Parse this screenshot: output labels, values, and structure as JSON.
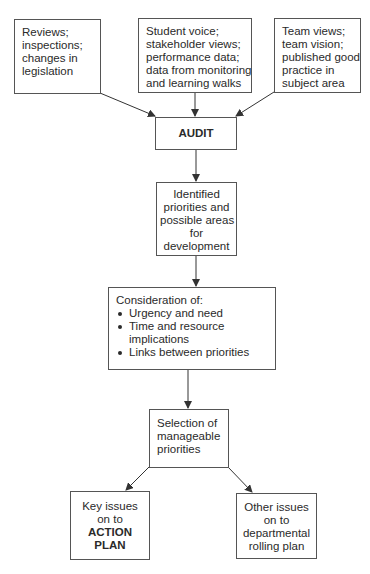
{
  "diagram": {
    "type": "flowchart",
    "inputs": [
      {
        "id": "reviews",
        "lines": [
          "Reviews;",
          "inspections;",
          "changes in",
          "legislation"
        ]
      },
      {
        "id": "student-voice",
        "lines": [
          "Student voice;",
          "stakeholder views;",
          "performance data;",
          "data from monitoring",
          "and learning walks"
        ]
      },
      {
        "id": "team-views",
        "lines": [
          "Team views;",
          "team vision;",
          "published good",
          "practice in",
          "subject area"
        ]
      }
    ],
    "audit": {
      "label": "AUDIT"
    },
    "identified": {
      "lines": [
        "Identified",
        "priorities and",
        "possible areas",
        "for",
        "development"
      ]
    },
    "consideration": {
      "heading": "Consideration of:",
      "bullets": [
        {
          "lines": [
            "Urgency and need"
          ]
        },
        {
          "lines": [
            "Time and resource",
            "implications"
          ]
        },
        {
          "lines": [
            "Links between priorities"
          ]
        }
      ]
    },
    "selection": {
      "lines": [
        "Selection of",
        "manageable",
        "priorities"
      ]
    },
    "outputs": [
      {
        "id": "action-plan",
        "lines": [
          "Key issues",
          "on to"
        ],
        "bold_lines": [
          "ACTION",
          "PLAN"
        ]
      },
      {
        "id": "rolling-plan",
        "lines": [
          "Other issues",
          "on to",
          "departmental",
          "rolling plan"
        ]
      }
    ],
    "edges": [
      [
        "Reviews",
        "AUDIT"
      ],
      [
        "Student voice",
        "AUDIT"
      ],
      [
        "Team views",
        "AUDIT"
      ],
      [
        "AUDIT",
        "Identified priorities"
      ],
      [
        "Identified priorities",
        "Consideration of"
      ],
      [
        "Consideration of",
        "Selection of manageable priorities"
      ],
      [
        "Selection of manageable priorities",
        "Key issues on to ACTION PLAN"
      ],
      [
        "Selection of manageable priorities",
        "Other issues on to departmental rolling plan"
      ]
    ],
    "colors": {
      "border": "#555555",
      "text": "#2a2a2a",
      "arrow": "#333333"
    }
  }
}
